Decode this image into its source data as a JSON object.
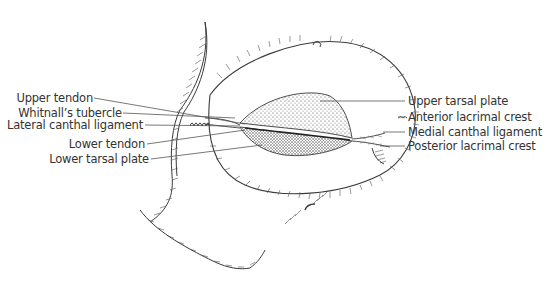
{
  "diagram": {
    "colors": {
      "line": "#3a3a3a",
      "label_text": "#333333",
      "leader_line": "#555555",
      "background": "#ffffff"
    },
    "labels_left": [
      {
        "id": "upper-tendon",
        "text": "Upper tendon"
      },
      {
        "id": "whitnalls-tubercle",
        "text": "Whitnall’s tubercle"
      },
      {
        "id": "lateral-canthal-ligament",
        "text": "Lateral canthal ligament"
      },
      {
        "id": "lower-tendon",
        "text": "Lower tendon"
      },
      {
        "id": "lower-tarsal-plate",
        "text": "Lower tarsal plate"
      }
    ],
    "labels_right": [
      {
        "id": "upper-tarsal-plate",
        "text": "Upper tarsal plate"
      },
      {
        "id": "anterior-lacrimal-crest",
        "text": "Anterior lacrimal crest"
      },
      {
        "id": "medial-canthal-ligament",
        "text": "Medial canthal ligament"
      },
      {
        "id": "posterior-lacrimal-crest",
        "text": "Posterior lacrimal crest"
      }
    ]
  }
}
